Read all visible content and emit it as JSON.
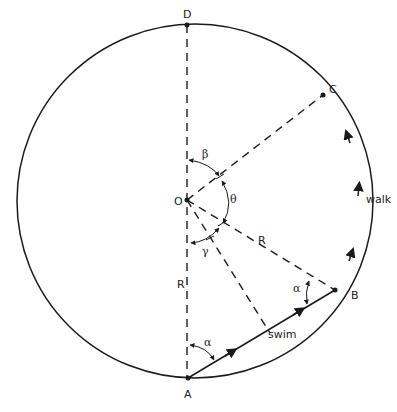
{
  "diagram": {
    "points": {
      "D": "D",
      "C": "C",
      "O": "O",
      "B": "B",
      "A": "A"
    },
    "angles": {
      "beta": "β",
      "theta": "θ",
      "gamma": "γ",
      "alpha_at_A": "α",
      "alpha_at_B": "α"
    },
    "radius_labels": {
      "R_OB": "R",
      "R_OA": "R"
    },
    "path_labels": {
      "swim": "swim",
      "walk": "walk"
    },
    "colors": {
      "stroke": "#1a1a1a",
      "background": "#ffffff"
    }
  }
}
